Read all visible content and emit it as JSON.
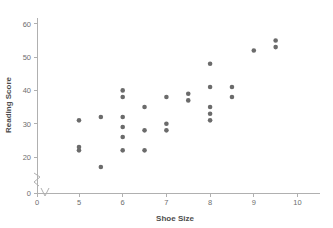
{
  "chart_data": {
    "type": "scatter",
    "title": "",
    "xlabel": "Shoe Size",
    "ylabel": "Reading Score",
    "xlim": [
      4.6,
      10.4
    ],
    "ylim": [
      14,
      63
    ],
    "grid": false,
    "legend": null,
    "axis_break_x": true,
    "axis_break_y": true,
    "xticks": [
      0,
      5,
      6,
      7,
      8,
      9,
      10
    ],
    "xtick_labels": [
      "0",
      "5",
      "6",
      "7",
      "8",
      "9",
      "10"
    ],
    "yticks": [
      0,
      20,
      30,
      40,
      50,
      60
    ],
    "ytick_labels": [
      "0",
      "20",
      "30",
      "40",
      "50",
      "60"
    ],
    "marker_color": "#6b6b6b",
    "axis_color": "#b0b0b0",
    "label_color": "#6e6e6e",
    "title_color": "#4d4d4d",
    "background": "#ffffff",
    "points": [
      {
        "x": 5.0,
        "y": 31
      },
      {
        "x": 5.0,
        "y": 23
      },
      {
        "x": 5.0,
        "y": 22
      },
      {
        "x": 5.5,
        "y": 32
      },
      {
        "x": 5.5,
        "y": 17
      },
      {
        "x": 6.0,
        "y": 40
      },
      {
        "x": 6.0,
        "y": 38
      },
      {
        "x": 6.0,
        "y": 32
      },
      {
        "x": 6.0,
        "y": 29
      },
      {
        "x": 6.0,
        "y": 26
      },
      {
        "x": 6.0,
        "y": 22
      },
      {
        "x": 6.5,
        "y": 35
      },
      {
        "x": 6.5,
        "y": 28
      },
      {
        "x": 6.5,
        "y": 22
      },
      {
        "x": 7.0,
        "y": 38
      },
      {
        "x": 7.0,
        "y": 30
      },
      {
        "x": 7.0,
        "y": 28
      },
      {
        "x": 7.5,
        "y": 39
      },
      {
        "x": 7.5,
        "y": 37
      },
      {
        "x": 8.0,
        "y": 48
      },
      {
        "x": 8.0,
        "y": 41
      },
      {
        "x": 8.0,
        "y": 35
      },
      {
        "x": 8.0,
        "y": 33
      },
      {
        "x": 8.0,
        "y": 31
      },
      {
        "x": 8.5,
        "y": 41
      },
      {
        "x": 8.5,
        "y": 38
      },
      {
        "x": 9.0,
        "y": 52
      },
      {
        "x": 9.5,
        "y": 55
      },
      {
        "x": 9.5,
        "y": 53
      }
    ]
  }
}
